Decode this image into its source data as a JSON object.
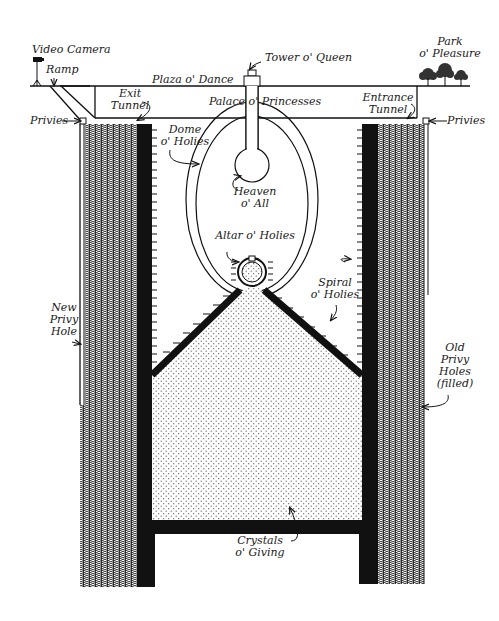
{
  "diagram": {
    "type": "cross-section illustration",
    "colors": {
      "ink": "#111111",
      "fill_dots": "#888888",
      "background": "#ffffff"
    },
    "labels": {
      "video_camera": "Video Camera",
      "ramp": "Ramp",
      "plaza": "Plaza o' Dance",
      "tower": "Tower o' Queen",
      "park_line1": "Park",
      "park_line2": "o' Pleasure",
      "exit_line1": "Exit",
      "exit_line2": "Tunnel",
      "palace": "Palace o' Princesses",
      "entrance_line1": "Entrance",
      "entrance_line2": "Tunnel",
      "privies_left": "Privies",
      "privies_right": "Privies",
      "dome_line1": "Dome",
      "dome_line2": "o' Holies",
      "heaven_line1": "Heaven",
      "heaven_line2": "o' All",
      "altar": "Altar o' Holies",
      "spiral_line1": "Spiral",
      "spiral_line2": "o' Holies",
      "new_privy_line1": "New",
      "new_privy_line2": "Privy",
      "new_privy_line3": "Hole",
      "old_privy_line1": "Old",
      "old_privy_line2": "Privy",
      "old_privy_line3": "Holes",
      "old_privy_line4": "(filled)",
      "crystals_line1": "Crystals",
      "crystals_line2": "o' Giving"
    }
  }
}
